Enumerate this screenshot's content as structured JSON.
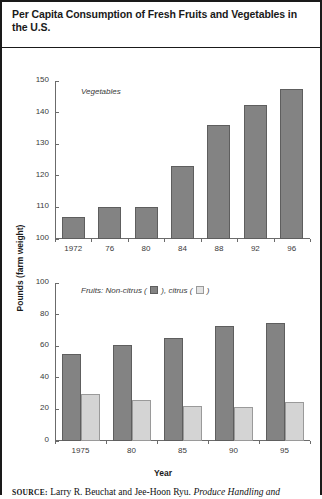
{
  "figure": {
    "title": "Per Capita Consumption of Fresh Fruits and Vegetables in the U.S.",
    "y_axis_label": "Pounds (farm weight)",
    "x_axis_label": "Year",
    "source_prefix": "SOURCE:",
    "source_text": " Larry R. Beuchat and Jee-Hoon Ryu. ",
    "source_italic": "Produce Handling and"
  },
  "colors": {
    "dark_fill": "#838383",
    "dark_stroke": "#5e5e5e",
    "light_fill": "#d4d4d4",
    "light_stroke": "#9a9a9a",
    "axis": "#6b6b6b",
    "text": "#1a1a1a"
  },
  "legend": {
    "top_note": "Vegetables",
    "bottom_prefix": "Fruits: Non-citrus (",
    "bottom_middle": "), citrus (",
    "bottom_suffix": ")",
    "swatch_non_citrus": "dark-square-swatch",
    "swatch_citrus": "light-square-swatch"
  },
  "chart_data": [
    {
      "type": "bar",
      "id": "vegetables",
      "title": "Vegetables",
      "xlabel": "",
      "ylabel": "Pounds (farm weight)",
      "categories": [
        "1972",
        "76",
        "80",
        "84",
        "88",
        "92",
        "96"
      ],
      "values": [
        107,
        110,
        110,
        123,
        136,
        142.5,
        147.5
      ],
      "ylim": [
        100,
        150
      ],
      "yticks": [
        100,
        110,
        120,
        130,
        140,
        150
      ],
      "ytick_labels": [
        "100",
        "110",
        "120",
        "130",
        "140",
        "150"
      ],
      "grid": false,
      "legend_position": "inside-top-left",
      "series": [
        {
          "name": "Vegetables",
          "values": [
            107,
            110,
            110,
            123,
            136,
            142.5,
            147.5
          ]
        }
      ]
    },
    {
      "type": "bar",
      "id": "fruits",
      "title": "Fruits: Non-citrus ( ), citrus ( )",
      "xlabel": "Year",
      "ylabel": "Pounds (farm weight)",
      "categories": [
        "1975",
        "80",
        "85",
        "90",
        "95"
      ],
      "ylim": [
        0,
        100
      ],
      "yticks": [
        0,
        20,
        40,
        60,
        80,
        100
      ],
      "ytick_labels": [
        "0",
        "20",
        "40",
        "60",
        "80",
        "100"
      ],
      "grid": false,
      "legend_position": "inside-top-left",
      "series": [
        {
          "name": "Non-citrus",
          "values": [
            55,
            61,
            65.5,
            72.5,
            74.5
          ]
        },
        {
          "name": "citrus",
          "values": [
            30,
            26,
            22,
            21.5,
            25
          ]
        }
      ]
    }
  ]
}
